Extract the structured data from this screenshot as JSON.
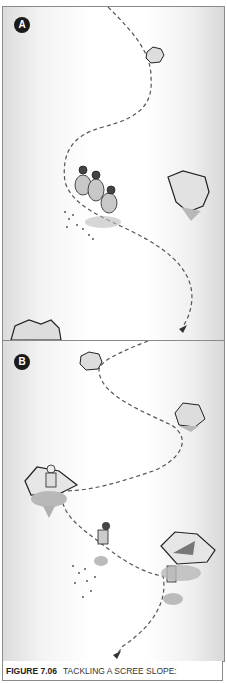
{
  "figure": {
    "number": "FIGURE 7.06",
    "title": "TACKLING A SCREE SLOPE:",
    "panels": [
      {
        "label": "A",
        "description": "Group of three climbers descending scree slope together along a zigzag dashed path"
      },
      {
        "label": "B",
        "description": "Climbers descending one at a time, sheltering behind boulders along the dashed path"
      }
    ],
    "colors": {
      "border": "#8a8a8a",
      "label_bg": "#1a1a1a",
      "path": "#555555",
      "rock_fill": "#d8d8d8",
      "shadow": "#b0b0b0"
    }
  }
}
